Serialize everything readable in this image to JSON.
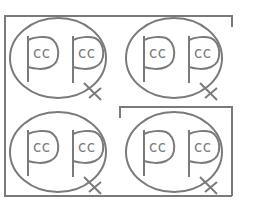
{
  "figure": {
    "stroke_color": "#7a7a7a",
    "background": "#ffffff",
    "cells": [
      {
        "id": "top-left",
        "glyphs": [
          {
            "letter": "p",
            "inner_text": "cc"
          },
          {
            "letter": "p-tail",
            "inner_text": "cc"
          }
        ]
      },
      {
        "id": "top-right",
        "glyphs": [
          {
            "letter": "p",
            "inner_text": "cc"
          },
          {
            "letter": "p-tail",
            "inner_text": "cc"
          }
        ]
      },
      {
        "id": "bottom-left",
        "glyphs": [
          {
            "letter": "p",
            "inner_text": "cc"
          },
          {
            "letter": "p-tail",
            "inner_text": "cc"
          }
        ]
      },
      {
        "id": "bottom-right",
        "glyphs": [
          {
            "letter": "p",
            "inner_text": "cc"
          },
          {
            "letter": "p-tail",
            "inner_text": "cc"
          }
        ]
      }
    ]
  }
}
